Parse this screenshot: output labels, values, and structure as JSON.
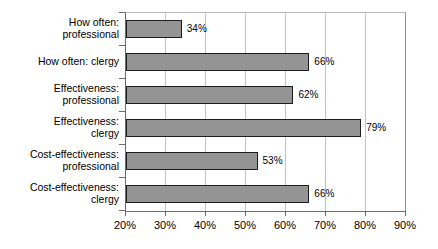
{
  "chart_data": {
    "type": "bar",
    "orientation": "horizontal",
    "title": "",
    "xlabel": "",
    "ylabel": "",
    "xlim": [
      20,
      90
    ],
    "xticks": [
      "20%",
      "30%",
      "40%",
      "50%",
      "60%",
      "70%",
      "80%",
      "90%"
    ],
    "xtick_step": 10,
    "grid": true,
    "legend": false,
    "value_label_suffix": "%",
    "bar_color": "#949494",
    "bar_border_color": "#1d1d1d",
    "gridline_color": "#c2c2c2",
    "axis_color": "#6a6a6a",
    "categories": [
      "How often:\nprofessional",
      "How often: clergy",
      "Effectiveness:\nprofessional",
      "Effectiveness:\nclergy",
      "Cost-effectiveness:\nprofessional",
      "Cost-effectiveness:\nclergy"
    ],
    "values": [
      34,
      66,
      62,
      79,
      53,
      66
    ],
    "value_labels": [
      "34%",
      "66%",
      "62%",
      "79%",
      "53%",
      "66%"
    ]
  }
}
